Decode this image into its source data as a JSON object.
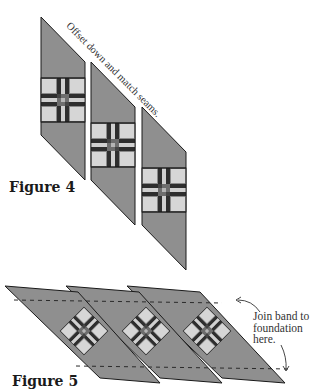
{
  "figure4": {
    "label": "Figure 4",
    "instruction": "Offset down and match seams.",
    "pieces": 3
  },
  "figure5": {
    "label": "Figure 5",
    "note_lines": [
      "Join band to",
      "foundation",
      "here."
    ],
    "pieces": 3
  },
  "colors": {
    "fabric_gray": "#8f8f8f",
    "block_dark": "#2e2e2e",
    "block_light": "#d6d6d6",
    "block_mid": "#7a7a7a",
    "outline": "#1a1a1a",
    "text": "#333333"
  }
}
